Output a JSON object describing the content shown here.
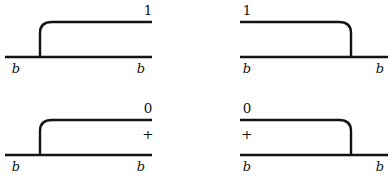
{
  "figure": {
    "background_color": "#ffffff",
    "stroke_color": "#131313",
    "panel_count": 4,
    "panels": [
      {
        "id": "top-left",
        "orientation": "left-cap-rising",
        "top_label": "1",
        "gap_label": "",
        "left_boundary_label": "b",
        "right_boundary_label": "b"
      },
      {
        "id": "top-right",
        "orientation": "right-cap-falling",
        "top_label": "1",
        "gap_label": "",
        "left_boundary_label": "b",
        "right_boundary_label": "b"
      },
      {
        "id": "bottom-left",
        "orientation": "left-cap-rising",
        "top_label": "0",
        "gap_label": "+",
        "left_boundary_label": "b",
        "right_boundary_label": "b"
      },
      {
        "id": "bottom-right",
        "orientation": "right-cap-falling",
        "top_label": "0",
        "gap_label": "+",
        "left_boundary_label": "b",
        "right_boundary_label": "b"
      }
    ]
  }
}
